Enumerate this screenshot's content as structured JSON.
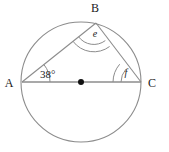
{
  "figure": {
    "name": "circle-theorem-diagram",
    "background_color": "#ffffff",
    "stroke_color": "#8c8c8c",
    "label_color": "#1a1a1a"
  },
  "circle": {
    "center_x": 81,
    "center_y": 82,
    "radius": 60,
    "center_dot_label": "center-point",
    "center_dot_radius": 3
  },
  "points": {
    "A": {
      "label": "A",
      "x": 22,
      "y": 82,
      "label_x": 9,
      "label_y": 87
    },
    "B": {
      "label": "B",
      "x": 96,
      "y": 23,
      "label_x": 93,
      "label_y": 12
    },
    "C": {
      "label": "C",
      "x": 141,
      "y": 82,
      "label_x": 147,
      "label_y": 87
    }
  },
  "angles": {
    "at_A": {
      "label": "38°",
      "value": 38,
      "units": "degrees",
      "arc_count": 1
    },
    "at_B": {
      "label": "e",
      "value": null,
      "units": "unknown",
      "arc_count": 2
    },
    "at_C": {
      "label": "f",
      "value": null,
      "units": "unknown",
      "arc_count": 2
    }
  },
  "segments": [
    {
      "name": "segment-AC-diameter",
      "from": "A",
      "to": "C"
    },
    {
      "name": "segment-AB",
      "from": "A",
      "to": "B"
    },
    {
      "name": "segment-BC",
      "from": "B",
      "to": "C"
    }
  ],
  "angle_label_positions": {
    "A": {
      "x": 40,
      "y": 78
    },
    "B": {
      "x": 93,
      "y": 37
    },
    "C": {
      "x": 126,
      "y": 76
    }
  }
}
